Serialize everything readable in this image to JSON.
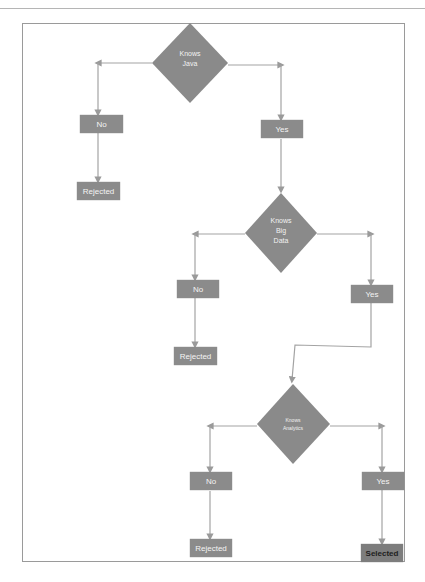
{
  "diagram": {
    "colors": {
      "shape_fill": "#8a8a8a",
      "connector": "#a0a0a0",
      "label": "#ffffff",
      "selected_label": "#1e1e1e"
    },
    "decisions": [
      {
        "id": "d1",
        "label_lines": [
          "Knows",
          "Java"
        ]
      },
      {
        "id": "d2",
        "label_lines": [
          "Knows",
          "Big",
          "Data"
        ]
      },
      {
        "id": "d3",
        "label_lines": [
          "Knows",
          "Analytics"
        ]
      }
    ],
    "nodes": {
      "no1": "No",
      "rejected1": "Rejected",
      "yes1": "Yes",
      "no2": "No",
      "rejected2": "Rejected",
      "yes2": "Yes",
      "no3": "No",
      "rejected3": "Rejected",
      "yes3": "Yes",
      "selected": "Selected"
    }
  }
}
